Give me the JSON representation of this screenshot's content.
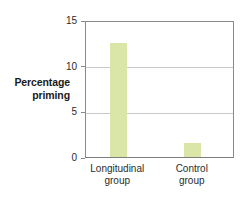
{
  "chart_data": {
    "type": "bar",
    "title": "",
    "subtitle": "",
    "xlabel": "",
    "ylabel": "Percentage priming",
    "ylabel_lines": [
      "Percentage",
      "priming"
    ],
    "categories": [
      "Longitudinal group",
      "Control group"
    ],
    "category_lines": [
      [
        "Longitudinal",
        "group"
      ],
      [
        "Control",
        "group"
      ]
    ],
    "values": [
      12.5,
      1.5
    ],
    "ylim": [
      0,
      15
    ],
    "yticks": [
      0,
      5,
      10,
      15
    ],
    "ytick_labels": [
      "0",
      "5",
      "10",
      "15"
    ],
    "gridlines_at": [
      5,
      10
    ],
    "grid": true,
    "legend": false,
    "legend_position": "none",
    "bar_color": "#d9e6a8",
    "axis_color": "#8a8a8a",
    "grid_color": "#c9c9c9",
    "text_color": "#2b2b2b",
    "annotations": []
  }
}
